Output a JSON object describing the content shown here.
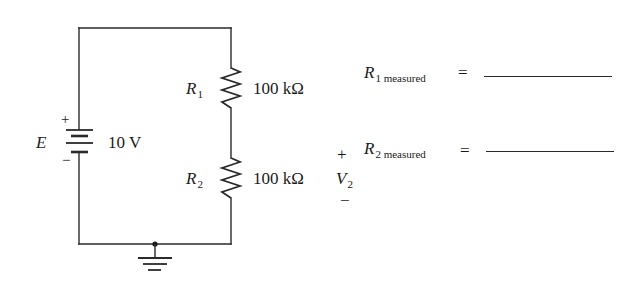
{
  "circuit": {
    "source": {
      "name": "E",
      "value": "10 V",
      "plus": "+",
      "minus": "−"
    },
    "resistors": [
      {
        "name": "R",
        "subscript": "1",
        "value": "100 kΩ"
      },
      {
        "name": "R",
        "subscript": "2",
        "value": "100 kΩ"
      }
    ],
    "output_voltage": {
      "plus": "+",
      "name": "V",
      "subscript": "2",
      "minus": "−"
    },
    "ground": "ground-symbol"
  },
  "measurements": [
    {
      "name": "R",
      "subscript": "1 measured",
      "equals": "=",
      "value": ""
    },
    {
      "name": "R",
      "subscript": "2 measured",
      "equals": "=",
      "value": ""
    }
  ],
  "colors": {
    "wire": "#2a2a2a",
    "text": "#1a1a1a",
    "background": "#ffffff"
  }
}
